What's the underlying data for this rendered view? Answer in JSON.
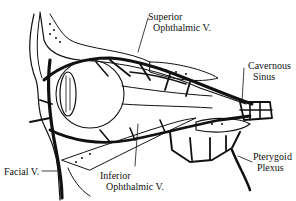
{
  "diagram": {
    "labels": {
      "superior_ophthalmic_line1": "Superior",
      "superior_ophthalmic_line2": "Ophthalmic V.",
      "cavernous_line1": "Cavernous",
      "cavernous_line2": "Sinus",
      "facial": "Facial V.",
      "inferior_ophthalmic_line1": "Inferior",
      "inferior_ophthalmic_line2": "Ophthalmic V.",
      "pterygoid_line1": "Pterygoid",
      "pterygoid_line2": "Plexus"
    },
    "colors": {
      "ink": "#111111",
      "background": "#ffffff"
    }
  }
}
